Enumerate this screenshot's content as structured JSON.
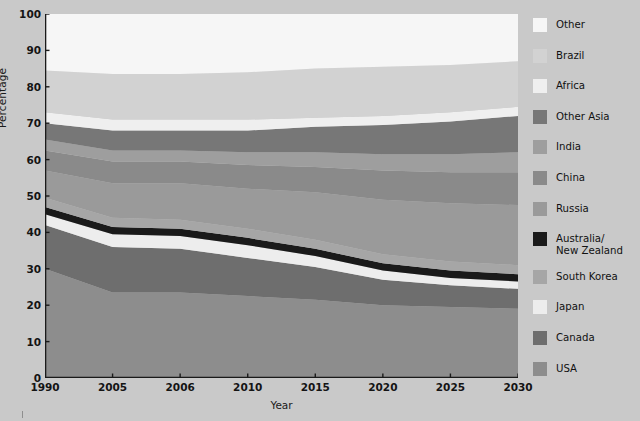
{
  "chart_data": {
    "type": "area",
    "stacked": true,
    "title": "",
    "xlabel": "Year",
    "ylabel": "Percentage",
    "ylim": [
      0,
      100
    ],
    "yticks": [
      0,
      10,
      20,
      30,
      40,
      50,
      60,
      70,
      80,
      90,
      100
    ],
    "categories": [
      "1990",
      "2005",
      "2006",
      "2010",
      "2015",
      "2020",
      "2025",
      "2030"
    ],
    "x": [
      1990,
      2005,
      2006,
      2010,
      2015,
      2020,
      2025,
      2030
    ],
    "grid": false,
    "legend_position": "right",
    "note": "Stacked area chart of percentage shares; series listed bottom-to-top in stack order. Legend is listed top-to-bottom matching the top-to-bottom visual order of the bands.",
    "series": [
      {
        "name": "USA",
        "color": "#8d8d8d",
        "values": [
          30.0,
          23.5,
          23.5,
          22.5,
          21.5,
          20.0,
          19.5,
          19.0
        ]
      },
      {
        "name": "Canada",
        "color": "#6e6e6e",
        "values": [
          12.0,
          12.5,
          12.0,
          10.5,
          9.0,
          7.0,
          6.0,
          5.5
        ]
      },
      {
        "name": "Japan",
        "color": "#ededed",
        "values": [
          3.0,
          3.5,
          3.5,
          3.5,
          3.0,
          2.5,
          2.0,
          2.0
        ]
      },
      {
        "name": "Australia/New Zealand",
        "color": "#1a1a1a",
        "values": [
          2.0,
          2.0,
          2.0,
          2.0,
          2.0,
          2.0,
          2.0,
          2.0
        ]
      },
      {
        "name": "South Korea",
        "color": "#a6a6a6",
        "values": [
          2.5,
          2.5,
          2.5,
          2.5,
          2.5,
          2.5,
          2.5,
          2.5
        ]
      },
      {
        "name": "Russia",
        "color": "#9a9a9a",
        "values": [
          7.5,
          9.5,
          10.0,
          11.0,
          13.0,
          15.0,
          16.0,
          16.5
        ]
      },
      {
        "name": "China",
        "color": "#8a8a8a",
        "values": [
          5.5,
          6.0,
          6.0,
          6.5,
          7.0,
          8.0,
          8.5,
          9.0
        ]
      },
      {
        "name": "India",
        "color": "#9e9e9e",
        "values": [
          3.0,
          3.0,
          3.0,
          3.5,
          4.0,
          4.5,
          5.0,
          5.5
        ]
      },
      {
        "name": "Other Asia",
        "color": "#777777",
        "values": [
          4.5,
          5.5,
          5.5,
          6.0,
          7.0,
          8.0,
          9.0,
          10.0
        ]
      },
      {
        "name": "Africa",
        "color": "#efefef",
        "values": [
          3.0,
          3.0,
          3.0,
          3.0,
          2.5,
          2.5,
          2.5,
          2.5
        ]
      },
      {
        "name": "Brazil",
        "color": "#d2d2d2",
        "values": [
          11.5,
          12.5,
          12.5,
          13.0,
          13.5,
          13.5,
          13.0,
          12.5
        ]
      },
      {
        "name": "Other",
        "color": "#f6f6f6",
        "values": [
          15.5,
          16.5,
          16.5,
          16.0,
          15.0,
          14.5,
          14.0,
          13.0
        ]
      }
    ],
    "legend_order": [
      "Other",
      "Brazil",
      "Africa",
      "Other Asia",
      "India",
      "China",
      "Russia",
      "Australia/\nNew Zealand",
      "South Korea",
      "Japan",
      "Canada",
      "USA"
    ]
  },
  "axes": {
    "ylabel": "Percentage",
    "xlabel": "Year",
    "yticks": [
      "100",
      "90",
      "80",
      "70",
      "60",
      "50",
      "40",
      "30",
      "20",
      "10",
      "0"
    ],
    "xticks": [
      "1990",
      "2005",
      "2006",
      "2010",
      "2015",
      "2020",
      "2025",
      "2030"
    ]
  },
  "legend": {
    "items": [
      {
        "label": "Other",
        "color": "#f6f6f6"
      },
      {
        "label": "Brazil",
        "color": "#d2d2d2"
      },
      {
        "label": "Africa",
        "color": "#efefef"
      },
      {
        "label": "Other Asia",
        "color": "#777777"
      },
      {
        "label": "India",
        "color": "#9e9e9e"
      },
      {
        "label": "China",
        "color": "#8a8a8a"
      },
      {
        "label": "Russia",
        "color": "#9a9a9a"
      },
      {
        "label": "Australia/\nNew Zealand",
        "color": "#1a1a1a"
      },
      {
        "label": "South Korea",
        "color": "#a6a6a6"
      },
      {
        "label": "Japan",
        "color": "#ededed"
      },
      {
        "label": "Canada",
        "color": "#6e6e6e"
      },
      {
        "label": "USA",
        "color": "#8d8d8d"
      }
    ]
  },
  "colors": {
    "page_background": "#c9c9c9",
    "axis_line": "#1a1a1a",
    "text": "#141414"
  }
}
